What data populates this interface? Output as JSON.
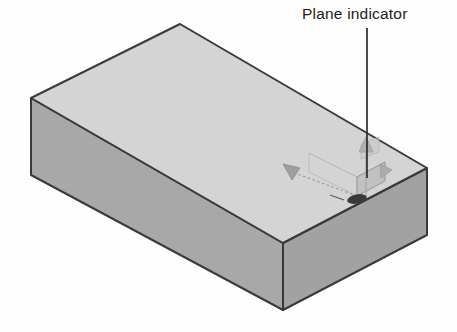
{
  "figure": {
    "type": "technical-illustration",
    "background_color": "#fefefe"
  },
  "callout": {
    "label": "Plane indicator",
    "leader_line": {
      "name": "leader-line",
      "color": "#2b2b2b",
      "x": 367,
      "y_start": 28,
      "y_end": 178
    }
  },
  "box": {
    "name": "rectangular-solid",
    "edge_color": "#3a3a3a",
    "top_face_color": "#d3d3d3",
    "left_face_color": "#a8a8a8",
    "right_face_color": "#a0a0a0",
    "vertices": {
      "top_apex": [
        180,
        24
      ],
      "left_top": [
        31,
        98
      ],
      "right_top": [
        427,
        168
      ],
      "front_top": [
        283,
        243
      ],
      "left_bottom": [
        31,
        175
      ],
      "right_bottom": [
        427,
        235
      ],
      "front_bottom": [
        283,
        310
      ]
    }
  },
  "gizmo": {
    "name": "plane-indicator-gizmo",
    "origin": [
      357,
      196
    ],
    "plane_patch": {
      "name": "plane-patch",
      "fill_color": "#bdbdbd",
      "stroke_color": "#9a9a9a"
    },
    "wireframe_color": "#b4b4b4",
    "axis_arrow_left": {
      "name": "axis-arrow-left",
      "tip": [
        283,
        166
      ],
      "fill_color": "#9e9e9e"
    },
    "axis_arrow_up": {
      "name": "axis-arrow-up",
      "tip": [
        371,
        139
      ],
      "fill_color": "#b0b0b0"
    },
    "axis_arrow_right": {
      "name": "axis-arrow-right",
      "fill_color": "#a8a8a8"
    },
    "origin_marker": {
      "name": "origin-marker",
      "fill_color": "#3a3a3a"
    },
    "dashed_shaft_color": "#9c9c9c"
  }
}
